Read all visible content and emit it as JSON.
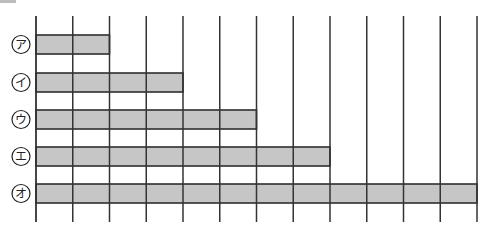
{
  "chart_data": {
    "type": "bar",
    "orientation": "horizontal",
    "title": "",
    "xlabel": "",
    "ylabel": "",
    "categories": [
      "ア",
      "イ",
      "ウ",
      "エ",
      "オ"
    ],
    "values": [
      2,
      4,
      6,
      8,
      12
    ],
    "xlim": [
      0,
      12
    ],
    "grid": {
      "vertical": true,
      "count": 13
    },
    "legend": null,
    "label_style": "circled-katakana"
  },
  "style": {
    "bar_fill": "#c6c6c6",
    "bar_stroke": "#2e2e2e",
    "grid_color": "#333333",
    "label_color": "#222222"
  },
  "layout": {
    "x0": 36,
    "unit": 36.75,
    "grid_top": 16,
    "grid_bottom": 222,
    "bar_tops": [
      35,
      73,
      110,
      147,
      184
    ],
    "bar_height": 19,
    "label_cx": 21,
    "label_r": 9
  }
}
